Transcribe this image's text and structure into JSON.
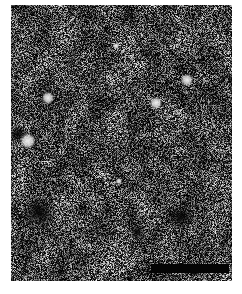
{
  "image": {
    "description": "Grayscale dark-field micrograph with speckled granular texture",
    "background_color": "#ffffff",
    "field_color": "#1a1a1a",
    "speckle_color": "#d8d8d8",
    "frame": {
      "x": 11,
      "y": 5,
      "width": 221,
      "height": 276
    }
  },
  "scale_bar": {
    "label": "",
    "color": "#050505",
    "x": 140,
    "y": 259,
    "width": 78,
    "height": 9
  },
  "bright_spots": [
    {
      "x": 37,
      "y": 93,
      "r": 4
    },
    {
      "x": 145,
      "y": 98,
      "r": 4
    },
    {
      "x": 17,
      "y": 136,
      "r": 5
    },
    {
      "x": 176,
      "y": 75,
      "r": 4
    },
    {
      "x": 108,
      "y": 176,
      "r": 2
    },
    {
      "x": 105,
      "y": 41,
      "r": 2
    }
  ],
  "dark_patches": [
    {
      "x": 15,
      "y": 200,
      "w": 26,
      "h": 16
    },
    {
      "x": 119,
      "y": 221,
      "w": 14,
      "h": 12
    },
    {
      "x": 160,
      "y": 206,
      "w": 20,
      "h": 12
    },
    {
      "x": 0,
      "y": 124,
      "w": 14,
      "h": 10
    }
  ]
}
